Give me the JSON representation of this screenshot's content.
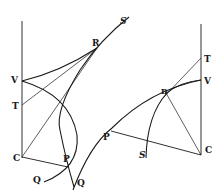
{
  "figure": {
    "left": {
      "labels": {
        "V": "V",
        "T": "T",
        "C": "C",
        "P": "P",
        "Q": "Q",
        "R": "R",
        "S": "S"
      }
    },
    "right": {
      "labels": {
        "T": "T",
        "V": "V",
        "C": "C",
        "P": "P",
        "Q": "Q",
        "S": "S",
        "n": "n"
      }
    },
    "colors": {
      "ink": "#1a1a1a",
      "paper": "#ffffff"
    }
  }
}
